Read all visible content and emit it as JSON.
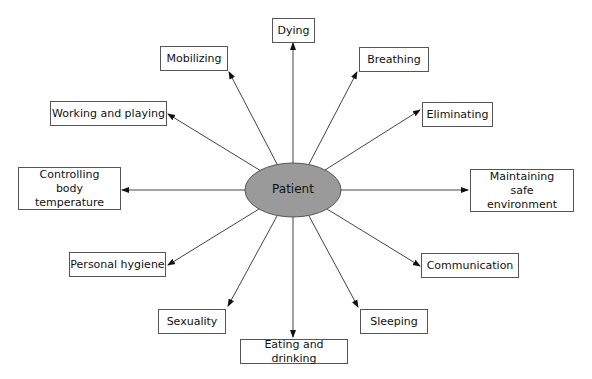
{
  "diagram": {
    "type": "hub-and-spoke",
    "center": {
      "label": "Patient",
      "fill": "#9a9a9a"
    },
    "nodes": [
      {
        "id": "dying",
        "label": "Dying"
      },
      {
        "id": "breathing",
        "label": "Breathing"
      },
      {
        "id": "eliminating",
        "label": "Eliminating"
      },
      {
        "id": "maintaining",
        "label": "Maintaining safe environment"
      },
      {
        "id": "communication",
        "label": "Communication"
      },
      {
        "id": "sleeping",
        "label": "Sleeping"
      },
      {
        "id": "eating",
        "label": "Eating and drinking"
      },
      {
        "id": "sexuality",
        "label": "Sexuality"
      },
      {
        "id": "hygiene",
        "label": "Personal hygiene"
      },
      {
        "id": "controlling",
        "label": "Controlling body temperature"
      },
      {
        "id": "working",
        "label": "Working and playing"
      },
      {
        "id": "mobilizing",
        "label": "Mobilizing"
      }
    ],
    "edges_direction": "center-to-node"
  }
}
